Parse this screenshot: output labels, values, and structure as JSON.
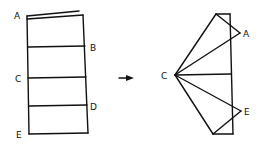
{
  "diagram": {
    "left_figure": {
      "labels": {
        "A": "A",
        "B": "B",
        "C": "C",
        "D": "D",
        "E": "E"
      }
    },
    "arrow": {
      "direction": "right"
    },
    "right_figure": {
      "labels": {
        "C": "C",
        "A": "A",
        "E": "E"
      }
    }
  }
}
